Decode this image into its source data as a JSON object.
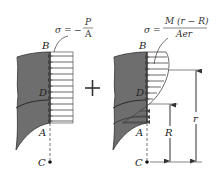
{
  "diagram": {
    "left_panel": {
      "formula": {
        "lhs": "σ",
        "equals": "=",
        "sign": "−",
        "numerator": "P",
        "denominator": "A"
      },
      "labels": {
        "top": "B",
        "middle": "D",
        "bottom": "A",
        "center": "C"
      },
      "description": "Uniform compressive axial stress distribution"
    },
    "operator": "+",
    "right_panel": {
      "formula": {
        "lhs": "σ",
        "equals": "=",
        "numerator": "M (r − R)",
        "denominator": "Aer"
      },
      "labels": {
        "top": "B",
        "middle": "D",
        "bottom": "A",
        "center": "C",
        "outer_dim": "r",
        "inner_dim": "R"
      },
      "description": "Hyperbolic bending stress distribution in curved beam"
    },
    "colors": {
      "section_fill": "#6e6e6e",
      "line": "#333333",
      "arrow": "#444444"
    }
  }
}
